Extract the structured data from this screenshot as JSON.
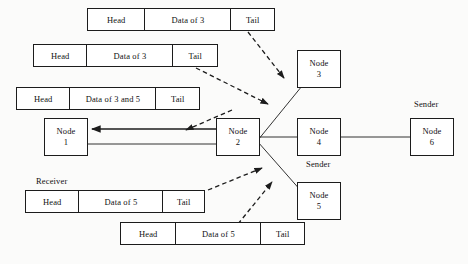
{
  "diagram": {
    "colors": {
      "stroke": "#1c1c1c",
      "background": "#fbfbfa",
      "box_fill": "#ffffff",
      "text": "#111111"
    },
    "packets": [
      {
        "id": "packet-top-data3",
        "x": 87,
        "y": 8,
        "width": 188,
        "cells": [
          {
            "label": "Head",
            "width": 58
          },
          {
            "label": "Data of 3",
            "width": 87
          },
          {
            "label": "Tail",
            "width": 43
          }
        ]
      },
      {
        "id": "packet-second-data3",
        "x": 33,
        "y": 44,
        "width": 185,
        "cells": [
          {
            "label": "Head",
            "width": 54
          },
          {
            "label": "Data of 3",
            "width": 87
          },
          {
            "label": "Tail",
            "width": 44
          }
        ]
      },
      {
        "id": "packet-coded-data3and5",
        "x": 16,
        "y": 87,
        "width": 184,
        "cells": [
          {
            "label": "Head",
            "width": 54
          },
          {
            "label": "Data of 3 and 5",
            "width": 87
          },
          {
            "label": "Tail",
            "width": 43
          }
        ]
      },
      {
        "id": "packet-receiver-data5",
        "x": 25,
        "y": 190,
        "width": 180,
        "cells": [
          {
            "label": "Head",
            "width": 54
          },
          {
            "label": "Data of 5",
            "width": 85
          },
          {
            "label": "Tail",
            "width": 41
          }
        ]
      },
      {
        "id": "packet-bottom-data5",
        "x": 120,
        "y": 222,
        "width": 185,
        "cells": [
          {
            "label": "Head",
            "width": 56
          },
          {
            "label": "Data of 5",
            "width": 86
          },
          {
            "label": "Tail",
            "width": 43
          }
        ]
      }
    ],
    "nodes": [
      {
        "id": "node-1",
        "label": "Node",
        "number": "1",
        "x": 44,
        "y": 118
      },
      {
        "id": "node-2",
        "label": "Node",
        "number": "2",
        "x": 216,
        "y": 118
      },
      {
        "id": "node-3",
        "label": "Node",
        "number": "3",
        "x": 297,
        "y": 50
      },
      {
        "id": "node-4",
        "label": "Node",
        "number": "4",
        "x": 297,
        "y": 118
      },
      {
        "id": "node-5",
        "label": "Node",
        "number": "5",
        "x": 297,
        "y": 182
      },
      {
        "id": "node-6",
        "label": "Node",
        "number": "6",
        "x": 410,
        "y": 118
      }
    ],
    "captions": [
      {
        "id": "caption-sender-node6",
        "text": "Sender",
        "x": 414,
        "y": 99
      },
      {
        "id": "caption-sender-node4",
        "text": "Sender",
        "x": 306,
        "y": 159
      },
      {
        "id": "caption-receiver",
        "text": "Receiver",
        "x": 36,
        "y": 176
      }
    ],
    "links_solid": [
      {
        "id": "link-node1-node2",
        "x1": 88,
        "y1": 144,
        "x2": 216,
        "y2": 144
      },
      {
        "id": "link-node2-node4",
        "x1": 260,
        "y1": 137,
        "x2": 297,
        "y2": 137
      },
      {
        "id": "link-node4-node6",
        "x1": 341,
        "y1": 137,
        "x2": 410,
        "y2": 137
      },
      {
        "id": "link-node2-node3",
        "x1": 258,
        "y1": 140,
        "x2": 302,
        "y2": 86
      },
      {
        "id": "link-node2-node5",
        "x1": 258,
        "y1": 142,
        "x2": 302,
        "y2": 192
      }
    ],
    "arrows_solid": [
      {
        "id": "arrow-node2-to-node1",
        "x1": 220,
        "y1": 129,
        "x2": 92,
        "y2": 129
      }
    ],
    "arrows_dashed": [
      {
        "id": "arrow-packet-data3-to-node2-upper",
        "x1": 248,
        "y1": 32,
        "x2": 284,
        "y2": 78
      },
      {
        "id": "arrow-packet-data3-to-node2-lower",
        "x1": 196,
        "y1": 68,
        "x2": 268,
        "y2": 104
      },
      {
        "id": "arrow-coded-packet-to-node1",
        "x1": 232,
        "y1": 110,
        "x2": 186,
        "y2": 130
      },
      {
        "id": "arrow-packet-data5-to-node2-upper",
        "x1": 208,
        "y1": 190,
        "x2": 262,
        "y2": 168
      },
      {
        "id": "arrow-packet-data5-to-node2-lower",
        "x1": 238,
        "y1": 224,
        "x2": 272,
        "y2": 182
      }
    ]
  }
}
